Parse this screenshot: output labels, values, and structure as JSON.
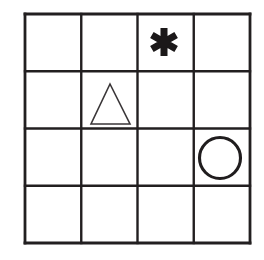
{
  "figure": {
    "name": "shape-grid",
    "background_color": "#ffffff",
    "line_color": "#221f20",
    "shape_stroke_color": "#201d1e",
    "asterisk_fill_color": "#1b1819",
    "triangle_stroke_color": "#3a3638"
  },
  "grid": {
    "rows": 4,
    "columns": 4,
    "left": 25,
    "top": 14,
    "right": 250,
    "bottom": 243,
    "cell_width": 56.25,
    "cell_height": 57.25,
    "outer_line_width": 2.8,
    "inner_line_width": 2.4,
    "x_lines": [
      25,
      81.25,
      137.5,
      193.75,
      250
    ],
    "y_lines": [
      14,
      71.25,
      128.5,
      185.75,
      243
    ],
    "cells": [
      {
        "row": 1,
        "column": 1,
        "content": "empty",
        "label": "r1c1"
      },
      {
        "row": 1,
        "column": 2,
        "content": "empty",
        "label": "r1c2"
      },
      {
        "row": 1,
        "column": 3,
        "content": "asterisk",
        "label": "r1c3"
      },
      {
        "row": 1,
        "column": 4,
        "content": "empty",
        "label": "r1c4"
      },
      {
        "row": 2,
        "column": 1,
        "content": "empty",
        "label": "r2c1"
      },
      {
        "row": 2,
        "column": 2,
        "content": "triangle",
        "label": "r2c2"
      },
      {
        "row": 2,
        "column": 3,
        "content": "empty",
        "label": "r2c3"
      },
      {
        "row": 2,
        "column": 4,
        "content": "empty",
        "label": "r2c4"
      },
      {
        "row": 3,
        "column": 1,
        "content": "empty",
        "label": "r3c1"
      },
      {
        "row": 3,
        "column": 2,
        "content": "empty",
        "label": "r3c2"
      },
      {
        "row": 3,
        "column": 3,
        "content": "empty",
        "label": "r3c3"
      },
      {
        "row": 3,
        "column": 4,
        "content": "circle",
        "label": "r3c4"
      },
      {
        "row": 4,
        "column": 1,
        "content": "empty",
        "label": "r4c1"
      },
      {
        "row": 4,
        "column": 2,
        "content": "empty",
        "label": "r4c2"
      },
      {
        "row": 4,
        "column": 3,
        "content": "empty",
        "label": "r4c3"
      },
      {
        "row": 4,
        "column": 4,
        "content": "empty",
        "label": "r4c4"
      }
    ]
  },
  "shapes": [
    {
      "id": "asterisk",
      "icon_name": "asterisk-icon",
      "row": 1,
      "column": 3,
      "center_x": 164,
      "center_y": 42,
      "width": 28,
      "height": 28,
      "arms": 6,
      "style": "filled-bold",
      "color": "#1b1819"
    },
    {
      "id": "triangle",
      "icon_name": "triangle-outline-icon",
      "row": 2,
      "column": 2,
      "apex_x": 110,
      "apex_y": 84,
      "base_left_x": 91,
      "base_right_x": 130,
      "base_y": 124,
      "style": "outline-thin",
      "color": "#3a3638"
    },
    {
      "id": "circle",
      "icon_name": "circle-outline-icon",
      "row": 3,
      "column": 4,
      "center_x": 220,
      "center_y": 158,
      "radius": 20.5,
      "style": "outline-bold",
      "color": "#201d1e"
    }
  ]
}
